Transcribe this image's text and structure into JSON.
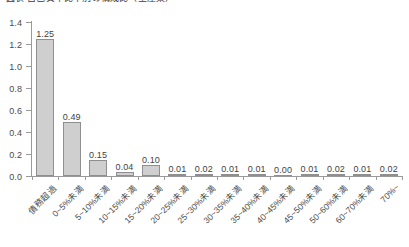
{
  "chart": {
    "title": "図表  自己資本比率別の構成比（全産業）"
  },
  "chart_data": {
    "type": "bar",
    "title": "図表  自己資本比率別の構成比（全産業）",
    "xlabel": "",
    "ylabel": "",
    "ylim": [
      0.0,
      1.4
    ],
    "ytick_labels": [
      "0.0",
      "0.2",
      "0.4",
      "0.6",
      "0.8",
      "1.0",
      "1.2",
      "1.4"
    ],
    "ytick_values": [
      0.0,
      0.2,
      0.4,
      0.6,
      0.8,
      1.0,
      1.2,
      1.4
    ],
    "grid": false,
    "legend": false,
    "bar_color": "#cfcfcf",
    "bar_border_color": "#8f8f8f",
    "axis_color": "#9a9a9a",
    "categories": [
      "債務超過",
      "0~5%未満",
      "5~10%未満",
      "10~15%未満",
      "15~20%未満",
      "20~25%未満",
      "25~30%未満",
      "30~35%未満",
      "35~40%未満",
      "40~45%未満",
      "45~50%未満",
      "50~60%未満",
      "60~70%未満",
      "70%~"
    ],
    "values": [
      1.25,
      0.49,
      0.15,
      0.04,
      0.1,
      0.01,
      0.02,
      0.01,
      0.01,
      0.0,
      0.01,
      0.02,
      0.01,
      0.02
    ],
    "value_labels": [
      "1.25",
      "0.49",
      "0.15",
      "0.04",
      "0.10",
      "0.01",
      "0.02",
      "0.01",
      "0.01",
      "0.00",
      "0.01",
      "0.02",
      "0.01",
      "0.02"
    ]
  }
}
